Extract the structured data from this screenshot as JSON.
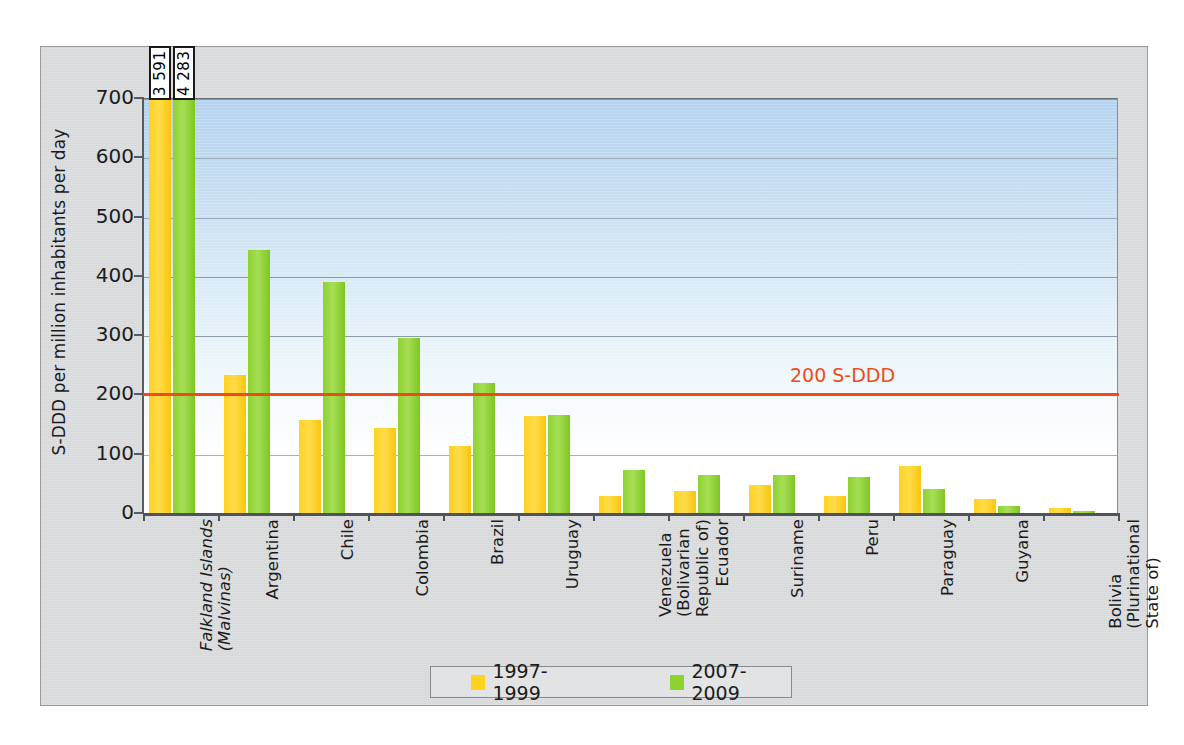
{
  "chart_data": {
    "type": "bar",
    "title": "",
    "xlabel": "",
    "ylabel": "S-DDD per million inhabitants per day",
    "ylim": [
      0,
      700
    ],
    "yticks": [
      0,
      100,
      200,
      300,
      400,
      500,
      600,
      700
    ],
    "grid": true,
    "legend_position": "bottom",
    "categories": [
      "Falkland Islands (Malvinas)",
      "Argentina",
      "Chile",
      "Colombia",
      "Brazil",
      "Uruguay",
      "Venezuela (Bolivarian Republic of)",
      "Ecuador",
      "Suriname",
      "Peru",
      "Paraguay",
      "Guyana",
      "Bolivia (Plurinational State of)"
    ],
    "category_lines": [
      [
        "Falkland Islands",
        "(Malvinas)"
      ],
      [
        "Argentina"
      ],
      [
        "Chile"
      ],
      [
        "Colombia"
      ],
      [
        "Brazil"
      ],
      [
        "Uruguay"
      ],
      [
        "Venezuela",
        "(Bolivarian",
        "Republic of)"
      ],
      [
        "Ecuador"
      ],
      [
        "Suriname"
      ],
      [
        "Peru"
      ],
      [
        "Paraguay"
      ],
      [
        "Guyana"
      ],
      [
        "Bolivia",
        "(Plurinational",
        "State of)"
      ]
    ],
    "category_italic": [
      true,
      false,
      false,
      false,
      false,
      false,
      false,
      false,
      false,
      false,
      false,
      false,
      false
    ],
    "series": [
      {
        "name": "1997-1999",
        "color": "#ffd21f",
        "values": [
          3591,
          233,
          157,
          143,
          113,
          164,
          28,
          37,
          47,
          29,
          79,
          23,
          8
        ]
      },
      {
        "name": "2007-2009",
        "color": "#8ed230",
        "values": [
          4283,
          443,
          389,
          296,
          219,
          166,
          73,
          64,
          64,
          61,
          41,
          12,
          4
        ]
      }
    ],
    "annotations": [
      {
        "name": "falkland-1997-value",
        "text": "3 591",
        "series": "1997-1999",
        "category": "Falkland Islands (Malvinas)"
      },
      {
        "name": "falkland-2007-value",
        "text": "4 283",
        "series": "2007-2009",
        "category": "Falkland Islands (Malvinas)"
      }
    ],
    "reference_line": {
      "label": "200 S-DDD",
      "value": 200,
      "color": "#f04a18"
    }
  },
  "legend": {
    "items": [
      {
        "label": "1997-1999",
        "color": "#ffd21f"
      },
      {
        "label": "2007-2009",
        "color": "#8ed230"
      }
    ]
  },
  "axis": {
    "y_title": "S-DDD per million inhabitants per day",
    "y_tick_labels": [
      "700",
      "600",
      "500",
      "400",
      "300",
      "200",
      "100",
      "0"
    ]
  }
}
